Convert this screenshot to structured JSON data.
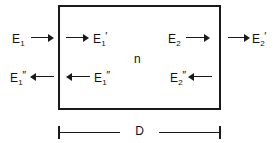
{
  "figure": {
    "type": "optics-slab-diagram",
    "medium": {
      "index_label": "n",
      "thickness_label": "D"
    },
    "fields": {
      "incident_left": {
        "base": "E",
        "subscript": "1",
        "prime": "",
        "direction": "right",
        "position": "outside-left"
      },
      "internal_forward_left": {
        "base": "E",
        "subscript": "1",
        "prime": "′",
        "direction": "right",
        "position": "inside-left"
      },
      "reflected_left": {
        "base": "E",
        "subscript": "1",
        "prime": "″",
        "direction": "left",
        "position": "outside-left"
      },
      "internal_backward_left": {
        "base": "E",
        "subscript": "1",
        "prime": "″",
        "direction": "left",
        "position": "inside-left"
      },
      "internal_forward_right": {
        "base": "E",
        "subscript": "2",
        "prime": "",
        "direction": "right",
        "position": "inside-right"
      },
      "transmitted_right": {
        "base": "E",
        "subscript": "2",
        "prime": "′",
        "direction": "right",
        "position": "outside-right"
      },
      "internal_backward_right": {
        "base": "E",
        "subscript": "2",
        "prime": "″",
        "direction": "left",
        "position": "inside-right"
      }
    },
    "colors": {
      "stroke": "#1a1a1a",
      "text": "#111111",
      "background": "#ffffff"
    }
  }
}
